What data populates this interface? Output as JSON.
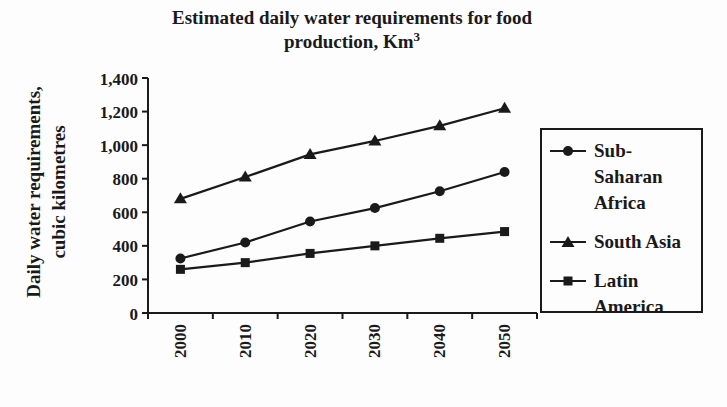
{
  "chart_data": {
    "type": "line",
    "title_full": "Estimated daily water requirements for food production, Km³",
    "title_line1": "Estimated daily water requirements for food",
    "title_line2": "production, Km",
    "title_line2_superscript": "3",
    "ylabel": "Daily water requirements, cubic kilometres",
    "ylabel_line1": "Daily water requirements,",
    "ylabel_line2": "cubic kilometres",
    "xlabel": "",
    "categories": [
      "2000",
      "2010",
      "2020",
      "2030",
      "2040",
      "2050"
    ],
    "series": [
      {
        "name": "Sub-Saharan Africa",
        "marker": "circle",
        "values": [
          325,
          420,
          545,
          625,
          725,
          840
        ]
      },
      {
        "name": "South Asia",
        "marker": "triangle",
        "values": [
          680,
          810,
          945,
          1025,
          1115,
          1220
        ]
      },
      {
        "name": "Latin America",
        "marker": "square",
        "values": [
          260,
          300,
          355,
          400,
          445,
          485
        ]
      }
    ],
    "ylim": [
      0,
      1400
    ],
    "ytick_step": 200,
    "ytick_labels": [
      "0",
      "200",
      "400",
      "600",
      "800",
      "1,000",
      "1,200",
      "1,400"
    ],
    "grid": false,
    "legend_position": "right",
    "line_color": "#1a1a1a",
    "background": "#fdfdfd"
  }
}
